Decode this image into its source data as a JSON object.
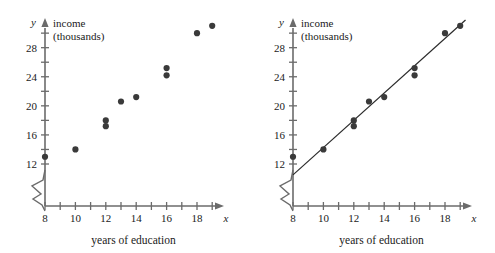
{
  "figure": {
    "panels": [
      "left-scatter",
      "right-scatter-with-line"
    ]
  },
  "chart_data": [
    {
      "type": "scatter",
      "panel": "left",
      "title": "",
      "xlabel": "years of education",
      "ylabel": "income (thousands)",
      "y_axis_name": "y",
      "x_axis_name": "x",
      "ylabel_line1": "income",
      "ylabel_line2": "(thousands)",
      "xlim": [
        8,
        19.6
      ],
      "ylim": [
        10,
        32
      ],
      "xticks": [
        8,
        9,
        10,
        11,
        12,
        13,
        14,
        15,
        16,
        17,
        18,
        19
      ],
      "xticklabels": [
        "8",
        "",
        "10",
        "",
        "12",
        "",
        "14",
        "",
        "16",
        "",
        "18",
        ""
      ],
      "yticks": [
        12,
        14,
        16,
        18,
        20,
        22,
        24,
        26,
        28,
        30
      ],
      "yticklabels": [
        "12",
        "",
        "16",
        "",
        "20",
        "",
        "24",
        "",
        "28",
        ""
      ],
      "grid": false,
      "axis_break": true,
      "legend": "none",
      "x": [
        8,
        10,
        12,
        12,
        13,
        14,
        16,
        16,
        18,
        19
      ],
      "y": [
        13,
        14,
        17.2,
        18,
        20.6,
        21.2,
        24.2,
        25.2,
        30,
        31
      ],
      "points": [
        {
          "x": 8,
          "y": 13
        },
        {
          "x": 10,
          "y": 14
        },
        {
          "x": 12,
          "y": 17.2
        },
        {
          "x": 12,
          "y": 18
        },
        {
          "x": 13,
          "y": 20.6
        },
        {
          "x": 14,
          "y": 21.2
        },
        {
          "x": 16,
          "y": 24.2
        },
        {
          "x": 16,
          "y": 25.2
        },
        {
          "x": 18,
          "y": 30
        },
        {
          "x": 19,
          "y": 31
        }
      ]
    },
    {
      "type": "scatter",
      "panel": "right",
      "title": "",
      "xlabel": "years of education",
      "ylabel": "income (thousands)",
      "y_axis_name": "y",
      "x_axis_name": "x",
      "ylabel_line1": "income",
      "ylabel_line2": "(thousands)",
      "xlim": [
        8,
        19.6
      ],
      "ylim": [
        10,
        32
      ],
      "xticks": [
        8,
        9,
        10,
        11,
        12,
        13,
        14,
        15,
        16,
        17,
        18,
        19
      ],
      "xticklabels": [
        "8",
        "",
        "10",
        "",
        "12",
        "",
        "14",
        "",
        "16",
        "",
        "18",
        ""
      ],
      "yticks": [
        12,
        14,
        16,
        18,
        20,
        22,
        24,
        26,
        28,
        30
      ],
      "yticklabels": [
        "12",
        "",
        "16",
        "",
        "20",
        "",
        "24",
        "",
        "28",
        ""
      ],
      "grid": false,
      "axis_break": true,
      "legend": "none",
      "x": [
        8,
        10,
        12,
        12,
        13,
        14,
        16,
        16,
        18,
        19
      ],
      "y": [
        13,
        14,
        17.2,
        18,
        20.6,
        21.2,
        24.2,
        25.2,
        30,
        31
      ],
      "points": [
        {
          "x": 8,
          "y": 13
        },
        {
          "x": 10,
          "y": 14
        },
        {
          "x": 12,
          "y": 17.2
        },
        {
          "x": 12,
          "y": 18
        },
        {
          "x": 13,
          "y": 20.6
        },
        {
          "x": 14,
          "y": 21.2
        },
        {
          "x": 16,
          "y": 24.2
        },
        {
          "x": 16,
          "y": 25.2
        },
        {
          "x": 18,
          "y": 30
        },
        {
          "x": 19,
          "y": 31
        }
      ],
      "trendline": {
        "type": "line",
        "x0": 8.0,
        "y0": 10.5,
        "x1": 19.35,
        "y1": 31.8
      }
    }
  ],
  "colors": {
    "dot": "#3a3a3a",
    "axis": "#6b6b6b",
    "line": "#2b2b2b",
    "text": "#1a1a1a",
    "background": "#ffffff"
  }
}
